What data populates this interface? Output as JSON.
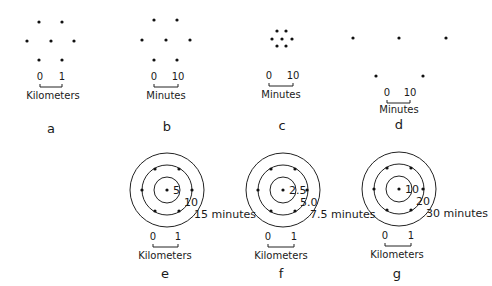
{
  "figure": {
    "panels": [
      {
        "id": "a",
        "label": "a",
        "type": "dot-pattern",
        "dots": [
          [
            39,
            22
          ],
          [
            62,
            22
          ],
          [
            27,
            41
          ],
          [
            51,
            41
          ],
          [
            74,
            41
          ],
          [
            39,
            60
          ],
          [
            62,
            60
          ]
        ],
        "scale": {
          "start": "0",
          "end": "1",
          "unit": "Kilometers",
          "x0": 40,
          "x1": 62,
          "tick_y": 80,
          "bar_y": 87,
          "unit_x": 53,
          "unit_y": 99
        }
      },
      {
        "id": "b",
        "label": "b",
        "type": "dot-pattern",
        "dots": [
          [
            154,
            20
          ],
          [
            177,
            20
          ],
          [
            142,
            40
          ],
          [
            166,
            40
          ],
          [
            190,
            40
          ],
          [
            154,
            60
          ],
          [
            177,
            60
          ]
        ],
        "scale": {
          "start": "0",
          "end": "10",
          "unit": "Minutes",
          "x0": 154,
          "x1": 178,
          "tick_y": 80,
          "bar_y": 87,
          "unit_x": 166,
          "unit_y": 99
        }
      },
      {
        "id": "c",
        "label": "c",
        "type": "dot-pattern",
        "dots": [
          [
            277,
            31
          ],
          [
            286,
            31
          ],
          [
            272,
            39
          ],
          [
            282,
            39
          ],
          [
            292,
            39
          ],
          [
            277,
            46
          ],
          [
            286,
            46
          ]
        ],
        "scale": {
          "start": "0",
          "end": "10",
          "unit": "Minutes",
          "x0": 269,
          "x1": 293,
          "tick_y": 79,
          "bar_y": 86,
          "unit_x": 281,
          "unit_y": 98
        }
      },
      {
        "id": "d",
        "label": "d",
        "type": "dot-pattern",
        "dots": [
          [
            353,
            38
          ],
          [
            399,
            38
          ],
          [
            446,
            38
          ],
          [
            376,
            76
          ],
          [
            423,
            76
          ]
        ],
        "scale": {
          "start": "0",
          "end": "10",
          "unit": "Minutes",
          "x0": 387,
          "x1": 410,
          "tick_y": 96,
          "bar_y": 103,
          "unit_x": 399,
          "unit_y": 113
        }
      },
      {
        "id": "e",
        "label": "e",
        "type": "isochrone",
        "center": [
          167,
          190
        ],
        "radii": [
          13,
          25,
          37
        ],
        "ring_labels": [
          "5",
          "10",
          "15 minutes"
        ],
        "ring_values": [
          5,
          10,
          15
        ],
        "ring_unit": "minutes",
        "ring_dots": [
          [
            155,
            169
          ],
          [
            179,
            169
          ],
          [
            142,
            190
          ],
          [
            192,
            190
          ],
          [
            155,
            211
          ],
          [
            179,
            211
          ]
        ],
        "scale": {
          "start": "0",
          "end": "1",
          "unit": "Kilometers",
          "x0": 153,
          "x1": 178,
          "tick_y": 240,
          "bar_y": 247,
          "unit_x": 165,
          "unit_y": 259
        }
      },
      {
        "id": "f",
        "label": "f",
        "type": "isochrone",
        "center": [
          283,
          190
        ],
        "radii": [
          13,
          25,
          37
        ],
        "ring_labels": [
          "2.5",
          "5.0",
          "7.5 minutes"
        ],
        "ring_values": [
          2.5,
          5.0,
          7.5
        ],
        "ring_unit": "minutes",
        "ring_dots": [
          [
            271,
            169
          ],
          [
            295,
            169
          ],
          [
            258,
            190
          ],
          [
            307,
            190
          ],
          [
            271,
            211
          ],
          [
            295,
            211
          ]
        ],
        "scale": {
          "start": "0",
          "end": "1",
          "unit": "Kilometers",
          "x0": 268,
          "x1": 294,
          "tick_y": 240,
          "bar_y": 247,
          "unit_x": 281,
          "unit_y": 259
        }
      },
      {
        "id": "g",
        "label": "g",
        "type": "isochrone",
        "center": [
          399,
          189
        ],
        "radii": [
          13,
          25,
          37
        ],
        "ring_labels": [
          "10",
          "20",
          "30 minutes"
        ],
        "ring_values": [
          10,
          20,
          30
        ],
        "ring_unit": "minutes",
        "ring_dots": [
          [
            387,
            168
          ],
          [
            411,
            168
          ],
          [
            374,
            189
          ],
          [
            423,
            189
          ],
          [
            387,
            210
          ],
          [
            411,
            210
          ]
        ],
        "scale": {
          "start": "0",
          "end": "1",
          "unit": "Kilometers",
          "x0": 385,
          "x1": 411,
          "tick_y": 239,
          "bar_y": 246,
          "unit_x": 397,
          "unit_y": 258
        }
      }
    ],
    "label_positions": {
      "a": [
        51,
        133
      ],
      "b": [
        167,
        131
      ],
      "c": [
        282,
        130
      ],
      "d": [
        399,
        129
      ],
      "e": [
        165,
        278
      ],
      "f": [
        281,
        278
      ],
      "g": [
        397,
        278
      ]
    },
    "colors": {
      "ink": "#1a1a1a",
      "background": "#ffffff"
    }
  }
}
